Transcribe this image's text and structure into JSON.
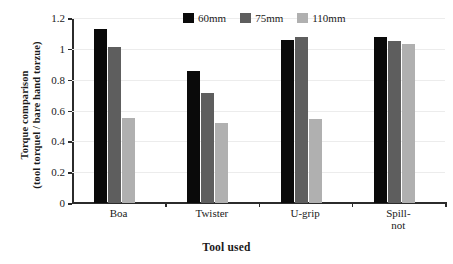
{
  "chart_data": {
    "type": "bar",
    "title": "",
    "xlabel": "Tool used",
    "ylabel_line1": "Torque comparison",
    "ylabel_line2": "(tool torquel / bare hand torzue)",
    "categories": [
      "Boa",
      "Twister",
      "U-grip",
      "Spill-\nnot"
    ],
    "series": [
      {
        "name": "60mm",
        "color": "#0a0a0a",
        "values": [
          1.13,
          0.855,
          1.055,
          1.08
        ]
      },
      {
        "name": "75mm",
        "color": "#5e5e5e",
        "values": [
          1.01,
          0.715,
          1.08,
          1.05
        ]
      },
      {
        "name": "110mm",
        "color": "#b0b0b0",
        "values": [
          0.55,
          0.52,
          0.545,
          1.03
        ]
      }
    ],
    "ylim": [
      0,
      1.2
    ],
    "yticks": [
      0,
      0.2,
      0.4,
      0.6,
      0.8,
      1,
      1.2
    ],
    "ytick_labels": [
      "0",
      "0.2",
      "0.4",
      "0.6",
      "0.8",
      "1",
      "1.2"
    ],
    "grid": true,
    "legend_position": "top-center"
  }
}
